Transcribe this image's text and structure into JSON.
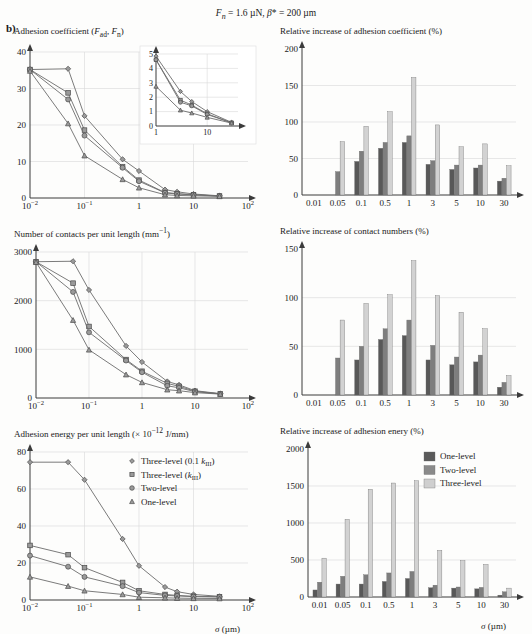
{
  "figure": {
    "panel_label": "b)",
    "title": "Fn = 1.6 µN, β* = 200 µm",
    "title_parts": {
      "f": "F",
      "fsub": "n",
      "eq1": " = 1.6 µN, ",
      "beta": "β* = 200 µm"
    },
    "xaxis_label": "σ (µm)"
  },
  "chart_data": [
    {
      "id": "adhesion-coefficient",
      "type": "line",
      "title": "Adhesion coefficient (Fad, Fn)",
      "title_plain": "Adhesion coefficient (F_ad, F_n)",
      "xlabel": "σ (µm)",
      "ylabel": "",
      "xscale": "log",
      "xlim": [
        0.01,
        100
      ],
      "ylim": [
        0,
        40
      ],
      "yticks": [
        0,
        10,
        20,
        30,
        40
      ],
      "xticks": [
        "10⁻²",
        "10⁻¹",
        "1",
        "10",
        "10²"
      ],
      "xtick_values": [
        0.01,
        0.1,
        1,
        10,
        100
      ],
      "grid": true,
      "x": [
        0.01,
        0.05,
        0.1,
        0.5,
        1,
        3,
        5,
        10,
        30
      ],
      "series": [
        {
          "name": "Three-level (0.1 kIII)",
          "marker": "diamond",
          "values": [
            35.2,
            35.4,
            22.5,
            10.6,
            7.4,
            2.3,
            1.7,
            1.1,
            0.6
          ]
        },
        {
          "name": "Three-level (kIII)",
          "marker": "square",
          "values": [
            35.2,
            28.8,
            18.6,
            8.6,
            4.9,
            1.5,
            1.2,
            0.9,
            0.55
          ]
        },
        {
          "name": "Two-level",
          "marker": "circle",
          "values": [
            35.2,
            27.0,
            17.1,
            8.3,
            4.6,
            1.4,
            1.1,
            0.85,
            0.55
          ]
        },
        {
          "name": "One-level",
          "marker": "triangle",
          "values": [
            34.8,
            20.4,
            11.6,
            5.1,
            2.8,
            0.9,
            0.7,
            0.6,
            0.45
          ]
        }
      ],
      "inset": {
        "xlim": [
          1,
          30
        ],
        "ylim": [
          0,
          5
        ],
        "yticks": [
          0,
          1,
          2,
          3,
          4,
          5
        ],
        "xticks": [
          "1",
          "10"
        ],
        "x": [
          1,
          3,
          5,
          10,
          30
        ],
        "series": [
          {
            "name": "Three-level (0.1 kIII)",
            "marker": "diamond",
            "values": [
              4.85,
              2.4,
              1.7,
              1.0,
              0.25
            ]
          },
          {
            "name": "Three-level (kIII)",
            "marker": "square",
            "values": [
              4.6,
              1.8,
              1.45,
              0.85,
              0.22
            ]
          },
          {
            "name": "Two-level",
            "marker": "circle",
            "values": [
              4.6,
              1.65,
              1.4,
              0.8,
              0.22
            ]
          },
          {
            "name": "One-level",
            "marker": "triangle",
            "values": [
              2.75,
              1.1,
              0.9,
              0.6,
              0.2
            ]
          }
        ]
      }
    },
    {
      "id": "relative-increase-adhesion-coefficient",
      "type": "bar",
      "title": "Relative increase of adhesion coefficient (%)",
      "xlabel": "",
      "ylabel": "",
      "ylim": [
        0,
        200
      ],
      "yticks": [
        0,
        50,
        100,
        150,
        200
      ],
      "categories": [
        "0.01",
        "0.05",
        "0.1",
        "0.5",
        "1",
        "3",
        "5",
        "10",
        "30"
      ],
      "grid": true,
      "series": [
        {
          "name": "One-level",
          "values": [
            0,
            0,
            46,
            64,
            72,
            42,
            35,
            37,
            19
          ]
        },
        {
          "name": "Two-level",
          "values": [
            0,
            32,
            60,
            72,
            81,
            47,
            41,
            41,
            23
          ]
        },
        {
          "name": "Three-level",
          "values": [
            0,
            73,
            94,
            114,
            161,
            96,
            66,
            70,
            40
          ]
        }
      ]
    },
    {
      "id": "number-of-contacts",
      "type": "line",
      "title": "Number of contacts per unit length (mm⁻¹)",
      "xlabel": "σ (µm)",
      "xscale": "log",
      "xlim": [
        0.01,
        100
      ],
      "ylim": [
        0,
        3000
      ],
      "yticks": [
        0,
        1000,
        2000,
        3000
      ],
      "xticks": [
        "10⁻²",
        "10⁻¹",
        "1",
        "10",
        "10²"
      ],
      "xtick_values": [
        0.01,
        0.1,
        1,
        10,
        100
      ],
      "grid": true,
      "x": [
        0.01,
        0.05,
        0.1,
        0.5,
        1,
        3,
        5,
        10,
        30
      ],
      "series": [
        {
          "name": "Three-level (0.1 kIII)",
          "marker": "diamond",
          "values": [
            2800,
            2810,
            2220,
            1070,
            740,
            340,
            270,
            150,
            90
          ]
        },
        {
          "name": "Three-level (kIII)",
          "marker": "square",
          "values": [
            2800,
            2360,
            1470,
            790,
            550,
            300,
            240,
            140,
            85
          ]
        },
        {
          "name": "Two-level",
          "marker": "circle",
          "values": [
            2800,
            2180,
            1350,
            770,
            530,
            250,
            210,
            130,
            85
          ]
        },
        {
          "name": "One-level",
          "marker": "triangle",
          "values": [
            2790,
            1600,
            990,
            480,
            320,
            170,
            150,
            110,
            80
          ]
        }
      ]
    },
    {
      "id": "relative-increase-contact-numbers",
      "type": "bar",
      "title": "Relative increase of contact numbers (%)",
      "ylim": [
        0,
        150
      ],
      "yticks": [
        0,
        50,
        100,
        150
      ],
      "categories": [
        "0.01",
        "0.05",
        "0.1",
        "0.5",
        "1",
        "3",
        "5",
        "10",
        "30"
      ],
      "grid": true,
      "series": [
        {
          "name": "One-level",
          "values": [
            0,
            0,
            36,
            57,
            61,
            36,
            31,
            34,
            8
          ]
        },
        {
          "name": "Two-level",
          "values": [
            0,
            38,
            50,
            68,
            77,
            51,
            39,
            41,
            13
          ]
        },
        {
          "name": "Three-level",
          "values": [
            0,
            77,
            94,
            103,
            138,
            102,
            85,
            68,
            20
          ]
        }
      ]
    },
    {
      "id": "adhesion-energy",
      "type": "line",
      "title": "Adhesion energy per unit length (× 10⁻¹² J/mm)",
      "xlabel": "σ (µm)",
      "xscale": "log",
      "xlim": [
        0.01,
        100
      ],
      "ylim": [
        0,
        80
      ],
      "yticks": [
        0,
        20,
        40,
        60,
        80
      ],
      "xticks": [
        "10⁻²",
        "10⁻¹",
        "1",
        "10",
        "10²"
      ],
      "xtick_values": [
        0.01,
        0.1,
        1,
        10,
        100
      ],
      "grid": true,
      "x": [
        0.01,
        0.05,
        0.1,
        0.5,
        1,
        3,
        5,
        10,
        30
      ],
      "legend_position": "upper-right",
      "series": [
        {
          "name": "Three-level (0.1 kIII)",
          "marker": "diamond",
          "values": [
            74.5,
            74.5,
            65.0,
            33.0,
            18.5,
            7.0,
            4.5,
            3.0,
            2.0
          ]
        },
        {
          "name": "Three-level (kIII)",
          "marker": "square",
          "values": [
            29.5,
            24.5,
            17.5,
            9.5,
            5.0,
            3.0,
            2.5,
            2.0,
            1.8
          ]
        },
        {
          "name": "Two-level",
          "marker": "circle",
          "values": [
            24.0,
            18.0,
            12.5,
            7.5,
            4.0,
            2.5,
            2.2,
            1.8,
            1.6
          ]
        },
        {
          "name": "One-level",
          "marker": "triangle",
          "values": [
            12.5,
            7.5,
            5.0,
            3.0,
            1.5,
            1.2,
            1.0,
            0.9,
            0.8
          ]
        }
      ]
    },
    {
      "id": "relative-increase-adhesion-energy",
      "type": "bar",
      "title": "Relative increase of adhesion enery (%)",
      "xlabel": "σ (µm)",
      "ylim": [
        0,
        2000
      ],
      "yticks": [
        0,
        500,
        1000,
        1500,
        2000
      ],
      "categories": [
        "0.01",
        "0.05",
        "0.1",
        "0.5",
        "1",
        "3",
        "5",
        "10",
        "30"
      ],
      "grid": true,
      "legend_position": "upper-right",
      "series": [
        {
          "name": "One-level",
          "values": [
            95,
            175,
            175,
            210,
            250,
            125,
            120,
            110,
            25
          ]
        },
        {
          "name": "Two-level",
          "values": [
            200,
            280,
            300,
            325,
            345,
            160,
            135,
            130,
            70
          ]
        },
        {
          "name": "Three-level",
          "values": [
            525,
            1050,
            1455,
            1540,
            1570,
            630,
            490,
            440,
            120
          ]
        }
      ]
    }
  ],
  "legends": {
    "line_legend": [
      {
        "label": "Three-level (0.1 kIII)",
        "marker": "diamond"
      },
      {
        "label": "Three-level (kIII)",
        "marker": "square"
      },
      {
        "label": "Two-level",
        "marker": "circle"
      },
      {
        "label": "One-level",
        "marker": "triangle"
      }
    ],
    "bar_legend": [
      {
        "label": "One-level",
        "color": "#5a5a5a"
      },
      {
        "label": "Two-level",
        "color": "#8a8a8a"
      },
      {
        "label": "Three-level",
        "color": "#cfcfcf"
      }
    ]
  },
  "colors": {
    "bar_one": "#585858",
    "bar_two": "#7e7e7e",
    "bar_three": "#d2d2d2",
    "axis": "#3b3b3b",
    "grid": "#d8d8d8",
    "marker_fill": "#9a9a9a"
  }
}
